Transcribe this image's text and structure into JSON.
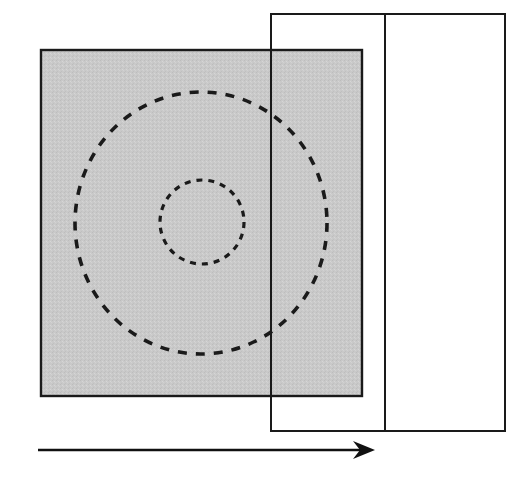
{
  "figure": {
    "title": "",
    "canvas": {
      "width": 530,
      "height": 486,
      "background": "#ffffff"
    },
    "colors": {
      "stroke": "#1a1a1a",
      "shaded_fill": "#c8c8c8",
      "plain_fill": "#ffffff",
      "arrow": "#111111"
    },
    "shapes": [
      {
        "id": "shaded-rectangle",
        "name": "shaded-rectangle",
        "kind": "rectangle",
        "fill": "shaded",
        "x": 41,
        "y": 50,
        "width": 321,
        "height": 346,
        "stroke_width": 2.4
      },
      {
        "id": "plain-rectangle-left",
        "name": "plain-rectangle-left",
        "kind": "rectangle",
        "fill": "none",
        "x": 271,
        "y": 14,
        "width": 114,
        "height": 417,
        "stroke_width": 2.0
      },
      {
        "id": "plain-rectangle-right",
        "name": "plain-rectangle-right",
        "kind": "rectangle",
        "fill": "none",
        "x": 385,
        "y": 14,
        "width": 120,
        "height": 417,
        "stroke_width": 2.0
      }
    ],
    "circles": [
      {
        "id": "outer-dashed-circle",
        "name": "outer-dashed-circle",
        "cx": 201,
        "cy": 223,
        "rx": 126,
        "ry": 131,
        "dash": "9 9",
        "stroke_width": 3.6
      },
      {
        "id": "inner-dashed-circle",
        "name": "inner-dashed-circle",
        "cx": 202,
        "cy": 222,
        "rx": 42,
        "ry": 42,
        "dash": "6 6",
        "stroke_width": 3.2
      }
    ],
    "arrow": {
      "id": "direction-arrow",
      "name": "direction-arrow",
      "label": "",
      "x1": 38,
      "y1": 450,
      "x2": 375,
      "y2": 450,
      "stroke_width": 2.6,
      "head_length": 22,
      "head_half_width": 9,
      "direction": "right"
    }
  }
}
